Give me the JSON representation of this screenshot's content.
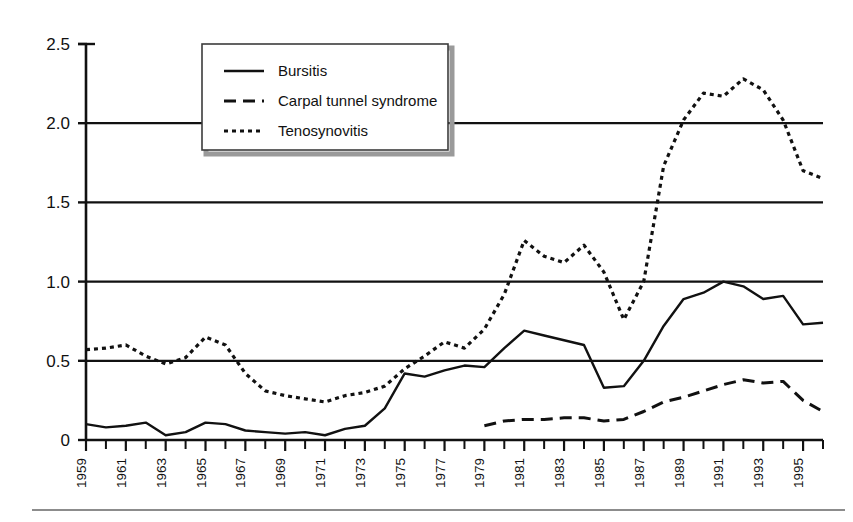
{
  "chart_data": {
    "type": "line",
    "title": "",
    "subtitle": "",
    "xlabel": "",
    "ylabel": "",
    "xlim": [
      1959,
      1996
    ],
    "ylim": [
      0,
      2.5
    ],
    "grid": true,
    "grid_axis": "y",
    "legend_position": "top-left-inside",
    "y_ticks": [
      "0",
      "0.5",
      "1.0",
      "1.5",
      "2.0",
      "2.5"
    ],
    "y_tick_values": [
      0,
      0.5,
      1.0,
      1.5,
      2.0,
      2.5
    ],
    "x_tick_labels": [
      "1959",
      "1961",
      "1963",
      "1965",
      "1967",
      "1969",
      "1971",
      "1973",
      "1975",
      "1977",
      "1979",
      "1981",
      "1983",
      "1985",
      "1987",
      "1989",
      "1991",
      "1993",
      "1995"
    ],
    "x_tick_values": [
      1959,
      1961,
      1963,
      1965,
      1967,
      1969,
      1971,
      1973,
      1975,
      1977,
      1979,
      1981,
      1983,
      1985,
      1987,
      1989,
      1991,
      1993,
      1995
    ],
    "x_minor_values": [
      1960,
      1962,
      1964,
      1966,
      1968,
      1970,
      1972,
      1974,
      1976,
      1978,
      1980,
      1982,
      1984,
      1986,
      1988,
      1990,
      1992,
      1994,
      1996
    ],
    "x": [
      1959,
      1960,
      1961,
      1962,
      1963,
      1964,
      1965,
      1966,
      1967,
      1968,
      1969,
      1970,
      1971,
      1972,
      1973,
      1974,
      1975,
      1976,
      1977,
      1978,
      1979,
      1980,
      1981,
      1982,
      1983,
      1984,
      1985,
      1986,
      1987,
      1988,
      1989,
      1990,
      1991,
      1992,
      1993,
      1994,
      1995,
      1996
    ],
    "series": [
      {
        "name": "Bursitis",
        "style": "solid",
        "color": "#111111",
        "x": [
          1959,
          1960,
          1961,
          1962,
          1963,
          1964,
          1965,
          1966,
          1967,
          1968,
          1969,
          1970,
          1971,
          1972,
          1973,
          1974,
          1975,
          1976,
          1977,
          1978,
          1979,
          1980,
          1981,
          1982,
          1983,
          1984,
          1985,
          1986,
          1987,
          1988,
          1989,
          1990,
          1991,
          1992,
          1993,
          1994,
          1995,
          1996
        ],
        "values": [
          0.1,
          0.08,
          0.09,
          0.11,
          0.03,
          0.05,
          0.11,
          0.1,
          0.06,
          0.05,
          0.04,
          0.05,
          0.03,
          0.07,
          0.09,
          0.2,
          0.42,
          0.4,
          0.44,
          0.47,
          0.46,
          0.58,
          0.69,
          0.66,
          0.63,
          0.6,
          0.33,
          0.34,
          0.5,
          0.72,
          0.89,
          0.93,
          1.0,
          0.97,
          0.89,
          0.91,
          0.73,
          0.74
        ]
      },
      {
        "name": "Carpal tunnel syndrome",
        "style": "dashed",
        "color": "#111111",
        "x": [
          1979,
          1980,
          1981,
          1982,
          1983,
          1984,
          1985,
          1986,
          1987,
          1988,
          1989,
          1990,
          1991,
          1992,
          1993,
          1994,
          1995,
          1996
        ],
        "values": [
          0.09,
          0.12,
          0.13,
          0.13,
          0.14,
          0.14,
          0.12,
          0.13,
          0.18,
          0.24,
          0.27,
          0.31,
          0.35,
          0.38,
          0.36,
          0.37,
          0.25,
          0.18
        ]
      },
      {
        "name": "Tenosynovitis",
        "style": "dotted",
        "color": "#111111",
        "x": [
          1959,
          1960,
          1961,
          1962,
          1963,
          1964,
          1965,
          1966,
          1967,
          1968,
          1969,
          1970,
          1971,
          1972,
          1973,
          1974,
          1975,
          1976,
          1977,
          1978,
          1979,
          1980,
          1981,
          1982,
          1983,
          1984,
          1985,
          1986,
          1987,
          1988,
          1989,
          1990,
          1991,
          1992,
          1993,
          1994,
          1995,
          1996
        ],
        "values": [
          0.57,
          0.58,
          0.6,
          0.53,
          0.48,
          0.52,
          0.65,
          0.6,
          0.42,
          0.31,
          0.28,
          0.26,
          0.24,
          0.28,
          0.3,
          0.34,
          0.45,
          0.53,
          0.62,
          0.58,
          0.7,
          0.92,
          1.26,
          1.16,
          1.12,
          1.23,
          1.06,
          0.76,
          1.0,
          1.73,
          2.02,
          2.19,
          2.17,
          2.28,
          2.21,
          2.02,
          1.7,
          1.65
        ]
      }
    ],
    "legend": [
      {
        "label": "Bursitis",
        "style": "solid"
      },
      {
        "label": "Carpal tunnel syndrome",
        "style": "dashed"
      },
      {
        "label": "Tenosynovitis",
        "style": "dotted"
      }
    ]
  },
  "colors": {
    "line": "#111111",
    "axis": "#111111",
    "grid": "#111111",
    "legend_border": "#9a9a9a",
    "legend_fill": "#ffffff",
    "page_background": "#ffffff",
    "footer_rule": "#8c8c8c"
  }
}
